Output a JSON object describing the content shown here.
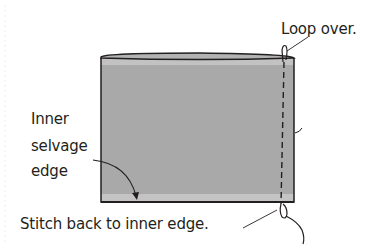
{
  "diagram": {
    "colors": {
      "fabric": "#a9a9a9",
      "fabric_edge_light": "#c4c4c4",
      "outline": "#231f20",
      "text": "#231f20"
    },
    "labels": {
      "loop_over": "Loop over.",
      "inner_selvage_line1": "Inner",
      "inner_selvage_line2": "selvage",
      "inner_selvage_line3": "edge",
      "stitch_back": "Stitch back to inner edge."
    },
    "elements": [
      {
        "id": "fabric-band",
        "shape": "rectangle",
        "description": "Gray fabric band with top rolled edge"
      },
      {
        "id": "stitch-line",
        "shape": "dashed vertical line",
        "description": "Stitching along right side"
      },
      {
        "id": "top-loop",
        "shape": "loop",
        "description": "Thread looping over top edge"
      },
      {
        "id": "bottom-loop",
        "shape": "loop with tail",
        "description": "Thread looping at bottom with trailing thread"
      },
      {
        "id": "selvage-arrow",
        "shape": "curved arrow",
        "description": "Points from label to inner selvage edge"
      }
    ]
  }
}
